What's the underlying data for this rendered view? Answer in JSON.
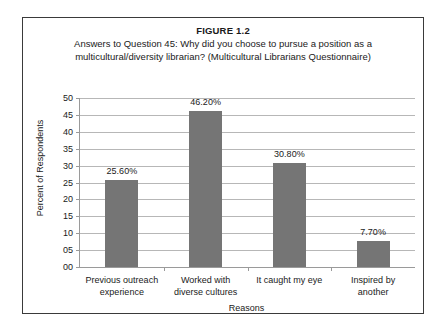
{
  "figure": {
    "number": "FIGURE 1.2",
    "caption_line1": "Answers to Question 45: Why did you choose to pursue a position as a",
    "caption_line2": "multicultural/diversity librarian? (Multicultural Librarians Questionnaire)"
  },
  "chart_data": {
    "type": "bar",
    "title": "Answers to Question 45: Why did you choose to pursue a position as a multicultural/diversity librarian? (Multicultural Librarians Questionnaire)",
    "categories": [
      "Previous outreach experience",
      "Worked with diverse cultures",
      "It caught my eye",
      "Inspired by another"
    ],
    "category_lines": [
      [
        "Previous outreach",
        "experience"
      ],
      [
        "Worked with",
        "diverse cultures"
      ],
      [
        "It caught my eye",
        ""
      ],
      [
        "Inspired by",
        "another"
      ]
    ],
    "values": [
      25.6,
      46.2,
      30.8,
      7.7
    ],
    "data_labels": [
      "25.60%",
      "46.20%",
      "30.80%",
      "7.70%"
    ],
    "xlabel": "Reasons",
    "ylabel": "Percent of Respondents",
    "ylim": [
      0,
      50
    ],
    "ytick_step": 5,
    "ytick_labels": [
      "00",
      "05",
      "10",
      "15",
      "20",
      "25",
      "30",
      "35",
      "40",
      "45",
      "50"
    ],
    "ytick_values": [
      0,
      5,
      10,
      15,
      20,
      25,
      30,
      35,
      40,
      45,
      50
    ],
    "grid": true,
    "legend": false,
    "bar_color": "#757575",
    "gridline_color": "#b7b7b7",
    "axis_color": "#9a9a9a"
  }
}
